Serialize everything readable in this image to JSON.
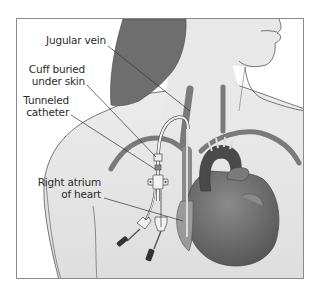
{
  "figure": {
    "labels": [
      {
        "id": "jugular-vein",
        "lines": [
          "Jugular vein"
        ]
      },
      {
        "id": "cuff",
        "lines": [
          "Cuff buried",
          "under skin"
        ]
      },
      {
        "id": "tunneled-catheter",
        "lines": [
          "Tunneled",
          "catheter"
        ]
      },
      {
        "id": "right-atrium",
        "lines": [
          "Right atrium",
          "of heart"
        ]
      }
    ]
  },
  "colors": {
    "frame_border": "#8a8a8a",
    "skin": "#e6e6e6",
    "skin_outline": "#555555",
    "hair": "#6e6e6e",
    "vessel": "#7a7a7a",
    "heart": "#6a6a6a",
    "heart_dark": "#4a4a4a",
    "catheter": "#f4f4f4",
    "leader_line": "#333333",
    "text": "#2b2b2b"
  }
}
